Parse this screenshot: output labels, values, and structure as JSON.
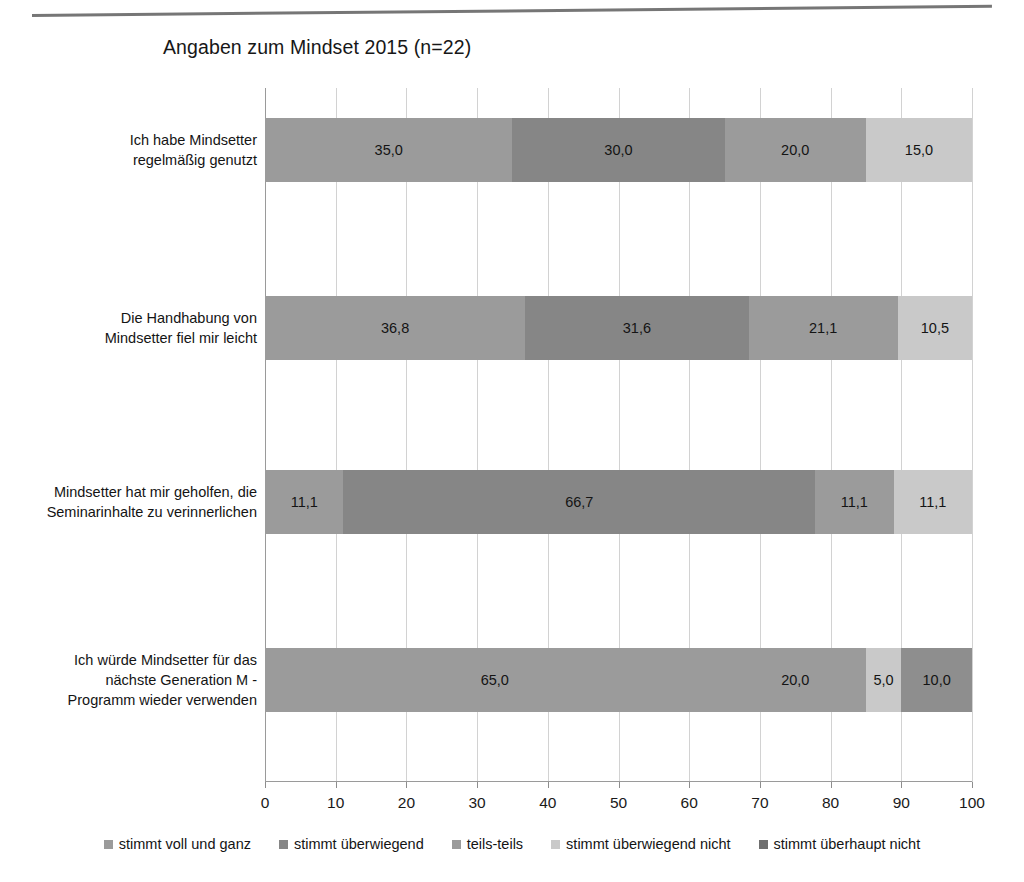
{
  "chart_data": {
    "type": "bar",
    "orientation": "horizontal",
    "stacked": true,
    "stack_mode": "percent",
    "title": "Angaben zum Mindset 2015 (n=22)",
    "xlabel": "",
    "ylabel": "",
    "xlim": [
      0,
      100
    ],
    "xticks": [
      "0",
      "10",
      "20",
      "30",
      "40",
      "50",
      "60",
      "70",
      "80",
      "90",
      "100"
    ],
    "grid": true,
    "legend_position": "bottom",
    "value_format": "comma-decimal",
    "categories": [
      "Ich habe Mindsetter regelmäßig genutzt",
      "Die Handhabung von Mindsetter fiel mir leicht",
      "Mindsetter hat mir geholfen, die Seminarinhalte zu verinnerlichen",
      "Ich würde Mindsetter für das nächste Generation M - Programm wieder verwenden"
    ],
    "category_lines": [
      [
        "Ich habe Mindsetter",
        "regelmäßig genutzt"
      ],
      [
        "Die Handhabung von",
        "Mindsetter fiel mir leicht"
      ],
      [
        "Mindsetter hat mir geholfen, die",
        "Seminarinhalte zu verinnerlichen"
      ],
      [
        "Ich würde Mindsetter für das",
        "nächste Generation M -",
        "Programm wieder verwenden"
      ]
    ],
    "series": [
      {
        "name": "stimmt voll und ganz",
        "color": "#9b9b9b",
        "values": [
          35.0,
          36.8,
          11.1,
          65.0
        ],
        "labels": [
          "35,0",
          "36,8",
          "11,1",
          "65,0"
        ]
      },
      {
        "name": "stimmt überwiegend",
        "color": "#868686",
        "values": [
          30.0,
          31.6,
          66.7,
          0.0
        ],
        "labels": [
          "30,0",
          "31,6",
          "66,7",
          ""
        ]
      },
      {
        "name": "teils-teils",
        "color": "#9b9b9b",
        "values": [
          20.0,
          21.1,
          11.1,
          20.0
        ],
        "labels": [
          "20,0",
          "21,1",
          "11,1",
          "20,0"
        ]
      },
      {
        "name": "stimmt überwiegend nicht",
        "color": "#c9c9c9",
        "values": [
          15.0,
          10.5,
          11.1,
          5.0
        ],
        "labels": [
          "15,0",
          "10,5",
          "11,1",
          "5,0"
        ]
      },
      {
        "name": "stimmt überhaupt nicht",
        "color": "#8e8e8e",
        "values": [
          0.0,
          0.0,
          0.0,
          10.0
        ],
        "labels": [
          "",
          "",
          "",
          "10,0"
        ]
      }
    ]
  },
  "legend": {
    "items": [
      {
        "label": "stimmt voll und ganz",
        "color": "#9b9b9b"
      },
      {
        "label": "stimmt überwiegend",
        "color": "#868686"
      },
      {
        "label": "teils-teils",
        "color": "#9b9b9b"
      },
      {
        "label": "stimmt überwiegend nicht",
        "color": "#c9c9c9"
      },
      {
        "label": "stimmt überhaupt nicht",
        "color": "#6f6f6f"
      }
    ]
  }
}
